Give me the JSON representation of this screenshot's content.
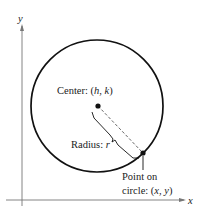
{
  "axes": {
    "x_label": "x",
    "y_label": "y"
  },
  "labels": {
    "center": "Center: (h, k)",
    "center_prefix": "Center: (",
    "center_h": "h",
    "center_sep": ", ",
    "center_k": "k",
    "center_suffix": ")",
    "radius_prefix": "Radius: ",
    "radius_var": "r",
    "point_line1": "Point on",
    "point_line2_prefix": "circle: (",
    "point_x": "x",
    "point_sep": ", ",
    "point_y": "y",
    "point_suffix": ")"
  },
  "colors": {
    "ink": "#111111",
    "dashed": "#555555"
  }
}
